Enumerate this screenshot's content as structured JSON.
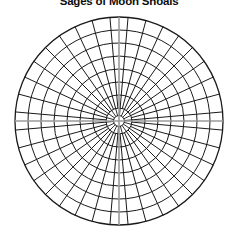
{
  "page": {
    "background_color": "#ffffff",
    "width": 238,
    "height": 238
  },
  "chart": {
    "title": "Sages of Moon Shoals",
    "title_color": "#0d0d0d",
    "title_truncated_top": true
  },
  "chart_data": {
    "type": "polar-grid",
    "title": "Sages of Moon Shoals",
    "subtitle": "",
    "xlabel": "",
    "ylabel": "",
    "center": {
      "x": 119,
      "y": 121
    },
    "outer_radius": 104,
    "inner_hub_radius": 13,
    "ring_count": 8,
    "ring_radii": [
      13,
      26,
      39,
      52,
      65,
      78,
      91,
      104
    ],
    "ring_labels": [
      "1",
      "2",
      "3",
      "4",
      "5",
      "6",
      "7",
      "8"
    ],
    "sector_count": 36,
    "sector_angle_degrees": 10,
    "angle_tick_labels": [
      "0",
      "10",
      "20",
      "30",
      "40",
      "50",
      "60",
      "70",
      "80",
      "90",
      "100",
      "110",
      "120",
      "130",
      "140",
      "150",
      "160",
      "170",
      "180",
      "190",
      "200",
      "210",
      "220",
      "230",
      "240",
      "250",
      "260",
      "270",
      "280",
      "290",
      "300",
      "310",
      "320",
      "330",
      "340",
      "350"
    ],
    "grid": true,
    "grid_color": "#1a1a1a",
    "grid_stroke_width": 1,
    "legend": false,
    "legend_position": "none",
    "crosshair": {
      "visible": true,
      "color": "#9a9a9a",
      "horizontal_y": 121,
      "vertical_x": 119
    },
    "series": [],
    "values": [],
    "categories": [],
    "rlim": [
      0,
      8
    ],
    "theta_lim": [
      0,
      360
    ]
  }
}
